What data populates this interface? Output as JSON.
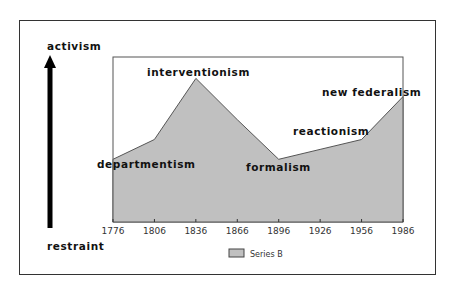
{
  "chart_data": {
    "type": "area",
    "title": "",
    "xlabel": "",
    "ylabel": "",
    "y_axis_top_label": "activism",
    "y_axis_bottom_label": "restraint",
    "categories": [
      "1776",
      "1806",
      "1836",
      "1866",
      "1896",
      "1926",
      "1956",
      "1986"
    ],
    "series": [
      {
        "name": "Series B",
        "values": [
          38,
          50,
          87,
          62,
          38,
          44,
          50,
          76
        ],
        "color": "#c0c0c0"
      }
    ],
    "ylim": [
      0,
      100
    ],
    "grid": false,
    "legend_position": "bottom",
    "annotations": [
      {
        "text": "departmentism",
        "x": "1776"
      },
      {
        "text": "interventionism",
        "x": "1836"
      },
      {
        "text": "formalism",
        "x": "1896"
      },
      {
        "text": "reactionism",
        "x": "1956"
      },
      {
        "text": "new federalism",
        "x": "1986"
      }
    ]
  },
  "legend": {
    "label": "Series B"
  },
  "colors": {
    "area_fill": "#c0c0c0",
    "area_stroke": "#555555",
    "frame": "#333333",
    "arrow": "#000000"
  }
}
